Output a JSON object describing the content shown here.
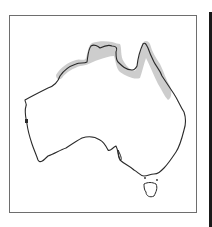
{
  "map": {
    "region": "Australia",
    "style": "outline range map",
    "range_area": "northern coastline (Kimberley, Top End, Gulf of Carpentaria, Cape York, north-east Queensland coast)",
    "colors": {
      "frame": "#6e6e6e",
      "coastline": "#2a2a2a",
      "range_fill": "#c8c8c8",
      "edge_bar": "#1a1a1a",
      "background": "#ffffff"
    },
    "icons": {
      "coastline": "australia-outline-icon",
      "range": "range-shading-icon",
      "tasmania": "tasmania-outline-icon"
    }
  }
}
